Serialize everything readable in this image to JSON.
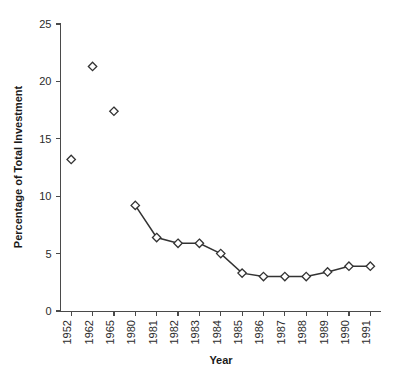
{
  "chart_data": {
    "type": "line",
    "title": "",
    "xlabel": "Year",
    "ylabel": "Percentage of Total Investment",
    "categories": [
      "1952",
      "1962",
      "1965",
      "1980",
      "1981",
      "1982",
      "1983",
      "1984",
      "1985",
      "1986",
      "1987",
      "1988",
      "1989",
      "1990",
      "1991"
    ],
    "values": [
      13.2,
      21.3,
      17.4,
      9.2,
      6.4,
      5.9,
      5.9,
      5.0,
      3.3,
      3.0,
      3.0,
      3.0,
      3.4,
      3.9,
      3.9
    ],
    "connected_from_index": 3,
    "ylim": [
      0,
      25
    ],
    "yticks": [
      0,
      5,
      10,
      15,
      20,
      25
    ],
    "ytick_labels": [
      "0",
      "5",
      "10",
      "15",
      "20",
      "25"
    ],
    "grid": false,
    "legend": "none",
    "marker": "diamond",
    "marker_fill": "#ffffff",
    "line_color": "#333333",
    "axis_color": "#4a4a4a",
    "text_color": "#2b2b2b",
    "background": "#ffffff"
  }
}
